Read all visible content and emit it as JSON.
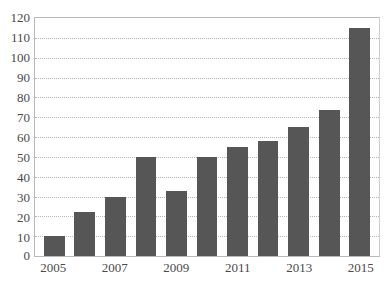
{
  "chart_data": {
    "type": "bar",
    "title": "",
    "xlabel": "",
    "ylabel": "",
    "categories": [
      "2005",
      "2006",
      "2007",
      "2008",
      "2009",
      "2010",
      "2011",
      "2012",
      "2013",
      "2014",
      "2015"
    ],
    "values": [
      10,
      22,
      30,
      50,
      33,
      50,
      55,
      58,
      65,
      73.5,
      115
    ],
    "visible_x_tick_labels": [
      "2005",
      "",
      "2007",
      "",
      "2009",
      "",
      "2011",
      "",
      "2013",
      "",
      "2015"
    ],
    "ylim": [
      0,
      120
    ],
    "ytick_step": 10,
    "yticks": [
      "120",
      "110",
      "100",
      "90",
      "80",
      "70",
      "60",
      "50",
      "40",
      "30",
      "20",
      "10",
      "0"
    ],
    "grid": true,
    "grid_axis": "y",
    "grid_style": "dotted",
    "legend": "none",
    "series": [
      {
        "name": "",
        "values": [
          10,
          22,
          30,
          50,
          33,
          50,
          55,
          58,
          65,
          73.5,
          115
        ]
      }
    ]
  },
  "style": {
    "bar_color": "#565656",
    "grid_color": "#b4b4b4",
    "axis_color": "#b9b9b9",
    "tick_label_color": "#4a4a4a",
    "background": "#ffffff"
  },
  "ghost_text": ""
}
